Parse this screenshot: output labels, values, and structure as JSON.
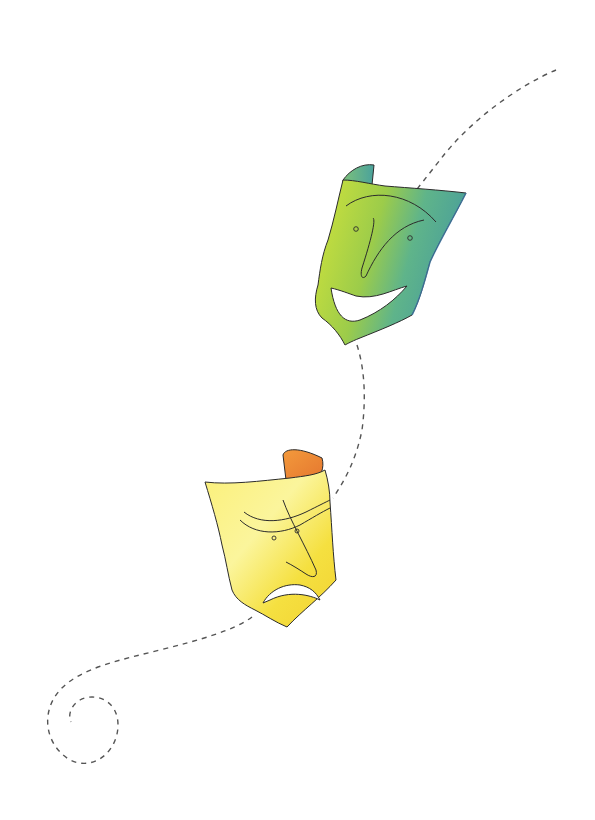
{
  "illustration": {
    "subject": "Comedy and tragedy theater masks connected by a dashed spiral path",
    "elements": [
      {
        "name": "comedy-mask",
        "expression": "smiling",
        "colors": [
          "#c8dc3a",
          "#5fb48a",
          "#4a9f95"
        ]
      },
      {
        "name": "tragedy-mask",
        "expression": "frowning",
        "colors": [
          "#fbef5a",
          "#f3d83a",
          "#ec8f3c"
        ]
      },
      {
        "name": "dashed-path",
        "style": "dashed",
        "color": "#555555"
      }
    ],
    "colors": {
      "background": "#ffffff",
      "outline": "#2b2b2b",
      "dash": "#555555",
      "comedy_light": "#cfe23c",
      "comedy_dark": "#4fa592",
      "tragedy_light": "#fdf48a",
      "tragedy_mid": "#f4dc3c",
      "tragedy_inside": "#ee8a3a"
    }
  }
}
